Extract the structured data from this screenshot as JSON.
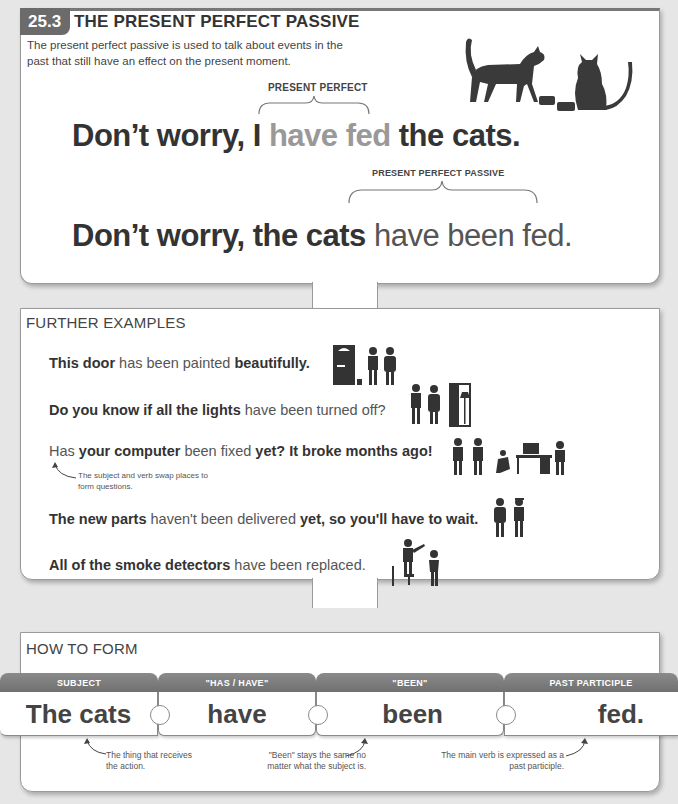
{
  "header": {
    "section_number": "25.3",
    "title": "THE PRESENT PERFECT PASSIVE",
    "intro": "The present perfect passive is used to talk about events in the past that still have an effect on the present moment."
  },
  "main_example": {
    "label_active": "PRESENT PERFECT",
    "active": {
      "pre": "Don’t worry, I ",
      "highlight": "have fed",
      "post": " the cats."
    },
    "label_passive": "PRESENT PERFECT PASSIVE",
    "passive": {
      "pre": "Don’t worry, the cats ",
      "highlight": "have been fed."
    },
    "illustration": "cats-with-food-bowls-icon"
  },
  "further_examples": {
    "heading": "FURTHER EXAMPLES",
    "items": [
      {
        "parts": [
          "This door",
          " has been painted ",
          "beautifully."
        ],
        "icon": "painter-door-icon"
      },
      {
        "parts": [
          "Do you know if all the lights",
          " have been turned off?",
          ""
        ],
        "icon": "people-lamp-icon"
      },
      {
        "parts": [
          "Has",
          " your computer ",
          "been fixed",
          " yet? It broke months ago!"
        ],
        "icon": "computer-repair-icon"
      },
      {
        "parts": [
          "The new parts",
          " haven't been delivered ",
          "yet, so you'll have to wait."
        ],
        "icon": "delivery-people-icon"
      },
      {
        "parts": [
          "All of the smoke detectors",
          " have been replaced."
        ],
        "icon": "smoke-detector-icon"
      }
    ],
    "note": "The subject and verb swap places to form questions."
  },
  "how_to_form": {
    "heading": "HOW TO FORM",
    "pieces": [
      {
        "header": "SUBJECT",
        "word": "The cats"
      },
      {
        "header": "\"HAS / HAVE\"",
        "word": "have"
      },
      {
        "header": "\"BEEN\"",
        "word": "been"
      },
      {
        "header": "PAST PARTICIPLE",
        "word": "fed."
      }
    ],
    "notes": [
      "The thing that receives the action.",
      "\"Been\" stays the same no matter what the subject is.",
      "The main verb is expressed as a past participle."
    ]
  }
}
